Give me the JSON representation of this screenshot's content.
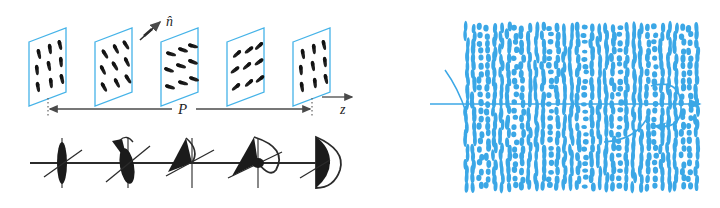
{
  "figure": {
    "background_color": "#ffffff"
  },
  "colors": {
    "plane_outline": "#45B3E8",
    "helix_blue": "#3BA7E6",
    "molecule_black": "#2b2b2b",
    "axis_gray": "#4a4a4a"
  },
  "labels": {
    "director": "n̂",
    "director_plain": "n",
    "pitch": "P",
    "axis": "z"
  },
  "left_panel": {
    "name": "stacked-planes-diagram",
    "description": "Five tilted square planes stacked along z, each containing rod-like molecules whose director rotates progressively through one full pitch P.",
    "plane_count": 5,
    "planes": [
      {
        "index": 1,
        "director_angle_deg": 90,
        "label": "plane-1",
        "molecule_count": 9
      },
      {
        "index": 2,
        "director_angle_deg": 62,
        "label": "plane-2",
        "molecule_count": 9
      },
      {
        "index": 3,
        "director_angle_deg": 18,
        "label": "plane-3",
        "molecule_count": 9
      },
      {
        "index": 4,
        "director_angle_deg": 140,
        "label": "plane-4",
        "molecule_count": 9
      },
      {
        "index": 5,
        "director_angle_deg": 90,
        "label": "plane-5",
        "molecule_count": 9
      }
    ],
    "pitch_label": "P",
    "axis_label": "z",
    "director_label": "n̂",
    "director_symbols": {
      "name": "director-rotation-symbols",
      "count": 5,
      "description": "Row of director symbols beneath the planes showing the cone/ellipse opening as the director rotates out of the viewing plane.",
      "open_fractions": [
        0.08,
        0.3,
        0.5,
        0.75,
        1.0
      ]
    }
  },
  "right_panel": {
    "name": "helix-texture-diagram",
    "description": "Dense blue rod texture showing the cholesteric helix viewed perpendicular to the helical axis; alternating bands of elongated rods and end-on dots.",
    "axis_arrow": "horizontal helical axis with arrowhead pointing right",
    "rotation_arrow": "circular twist arrow about the axis",
    "band_count": 7,
    "column_count": 34,
    "row_count": 22
  }
}
